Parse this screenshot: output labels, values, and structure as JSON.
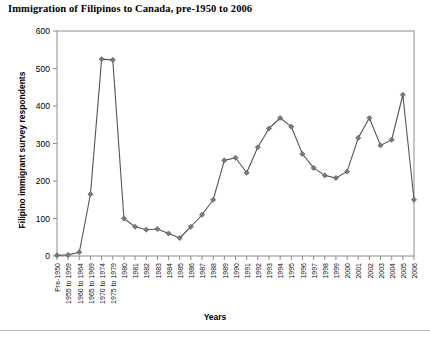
{
  "chart_data": {
    "type": "line",
    "title": "Immigration of Filipinos to Canada, pre-1950 to 2006",
    "xlabel": "Years",
    "ylabel": "Filipino immigrant survey respondents",
    "ylim": [
      0,
      600
    ],
    "yticks": [
      0,
      100,
      200,
      300,
      400,
      500,
      600
    ],
    "grid": false,
    "legend": "none",
    "marker": "diamond",
    "line_color": "#555555",
    "marker_color": "#7a7a7a",
    "categories": [
      "Pre-1950",
      "1955 to 1959",
      "1960 to 1964",
      "1965 to 1969",
      "1970 to 1974",
      "1975 to 1979",
      "1980",
      "1981",
      "1982",
      "1983",
      "1984",
      "1985",
      "1986",
      "1987",
      "1988",
      "1989",
      "1990",
      "1991",
      "1992",
      "1993",
      "1994",
      "1995",
      "1996",
      "1997",
      "1998",
      "1999",
      "2000",
      "2001",
      "2002",
      "2003",
      "2004",
      "2005",
      "2006"
    ],
    "values": [
      2,
      3,
      10,
      165,
      525,
      523,
      100,
      78,
      70,
      72,
      60,
      48,
      78,
      110,
      150,
      255,
      262,
      222,
      290,
      340,
      368,
      345,
      272,
      235,
      215,
      208,
      225,
      315,
      368,
      295,
      310,
      430,
      150
    ]
  }
}
